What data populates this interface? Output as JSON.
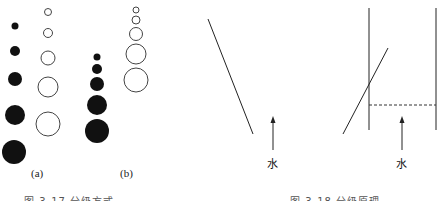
{
  "figure_left": {
    "panel_a": {
      "label": "(a)",
      "filled_circles": [
        {
          "cx": 15,
          "cy": 26,
          "r": 3.5
        },
        {
          "cx": 15,
          "cy": 51,
          "r": 5
        },
        {
          "cx": 15,
          "cy": 79,
          "r": 7
        },
        {
          "cx": 15,
          "cy": 115,
          "r": 10
        },
        {
          "cx": 14,
          "cy": 152,
          "r": 12
        }
      ],
      "open_circles": [
        {
          "cx": 48,
          "cy": 12,
          "r": 3.5
        },
        {
          "cx": 48,
          "cy": 33,
          "r": 4.5
        },
        {
          "cx": 48,
          "cy": 58,
          "r": 7
        },
        {
          "cx": 48,
          "cy": 87,
          "r": 10
        },
        {
          "cx": 48,
          "cy": 124,
          "r": 12
        }
      ]
    },
    "panel_b": {
      "label": "(b)",
      "filled_circles": [
        {
          "cx": 97,
          "cy": 57,
          "r": 3.5
        },
        {
          "cx": 97,
          "cy": 69,
          "r": 5
        },
        {
          "cx": 97,
          "cy": 84,
          "r": 7
        },
        {
          "cx": 97,
          "cy": 105,
          "r": 10
        },
        {
          "cx": 97,
          "cy": 131,
          "r": 12
        }
      ],
      "open_circles": [
        {
          "cx": 136,
          "cy": 10,
          "r": 3
        },
        {
          "cx": 136,
          "cy": 20,
          "r": 4
        },
        {
          "cx": 136,
          "cy": 34,
          "r": 6.5
        },
        {
          "cx": 136,
          "cy": 54,
          "r": 10
        },
        {
          "cx": 136,
          "cy": 80,
          "r": 12
        }
      ]
    },
    "caption": "图 3-17  分级方式"
  },
  "figure_right": {
    "v_diagram": {
      "water_label": "水",
      "left_line": [
        208,
        19,
        253,
        134
      ],
      "right_line": [
        343,
        134,
        388,
        48
      ]
    },
    "container_diagram": {
      "water_label": "水",
      "left_wall_x": 369,
      "right_wall_x": 436,
      "dashed_y": 105
    },
    "caption": "图 3-18  分级原理"
  },
  "colors": {
    "ink": "#111111",
    "outline": "#444444",
    "background": "#ffffff"
  }
}
